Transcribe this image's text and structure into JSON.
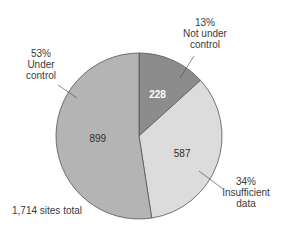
{
  "chart_data": {
    "type": "pie",
    "title": "",
    "total_label": "1,714 sites total",
    "total": 1714,
    "start": "12 o'clock, clockwise",
    "slices": [
      {
        "name": "Not under control",
        "value": 228,
        "percent_label": "13%",
        "label_lines": [
          "13%",
          "Not under",
          "control"
        ],
        "color": "#8c8c8c",
        "value_text_color": "#ffffff"
      },
      {
        "name": "Insufficient data",
        "value": 587,
        "percent_label": "34%",
        "label_lines": [
          "34%",
          "Insufficient",
          "data"
        ],
        "color": "#dcdcdc",
        "value_text_color": "#2e2e2e"
      },
      {
        "name": "Under control",
        "value": 899,
        "percent_label": "53%",
        "label_lines": [
          "53%",
          "Under",
          "control"
        ],
        "color": "#b4b4b4",
        "value_text_color": "#2e2e2e"
      }
    ],
    "outline_color": "#555555"
  }
}
